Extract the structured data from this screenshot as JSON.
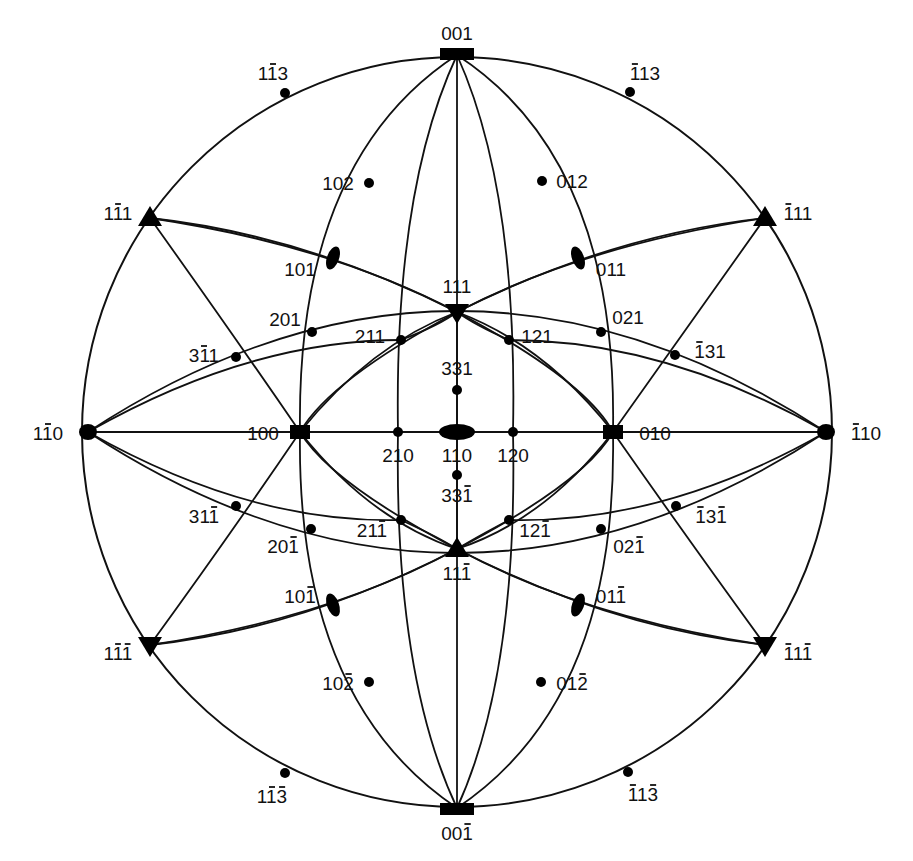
{
  "diagram": {
    "primitive_circle": {
      "cx": 457,
      "cy": 432,
      "r": 375
    },
    "colors": {
      "ink": "#111111",
      "background": "#ffffff"
    },
    "poles": [
      {
        "id": "p001",
        "label": "001",
        "bars": [],
        "x": 457,
        "y": 55,
        "symbol": "square",
        "lx": 457,
        "ly": 40,
        "anchor": "middle"
      },
      {
        "id": "p00m1",
        "label": "001",
        "bars": [
          2
        ],
        "x": 457,
        "y": 808,
        "symbol": "square",
        "lx": 457,
        "ly": 840,
        "anchor": "middle"
      },
      {
        "id": "p1m10",
        "label": "110",
        "bars": [
          1
        ],
        "x": 88,
        "y": 432,
        "symbol": "square-round",
        "lx": 48,
        "ly": 440,
        "anchor": "middle"
      },
      {
        "id": "pm110",
        "label": "110",
        "bars": [
          0
        ],
        "x": 826,
        "y": 432,
        "symbol": "square-round",
        "lx": 866,
        "ly": 440,
        "anchor": "middle"
      },
      {
        "id": "p110",
        "label": "110",
        "bars": [],
        "x": 457,
        "y": 432,
        "symbol": "ellipse-h",
        "lx": 457,
        "ly": 462,
        "anchor": "middle"
      },
      {
        "id": "p100",
        "label": "100",
        "bars": [],
        "x": 300,
        "y": 432,
        "symbol": "square",
        "lx": 263,
        "ly": 440,
        "anchor": "middle"
      },
      {
        "id": "p010",
        "label": "010",
        "bars": [],
        "x": 613,
        "y": 432,
        "symbol": "square",
        "lx": 655,
        "ly": 440,
        "anchor": "middle"
      },
      {
        "id": "p111",
        "label": "111",
        "bars": [],
        "x": 457,
        "y": 312,
        "symbol": "tri-down",
        "lx": 457,
        "ly": 293,
        "anchor": "middle"
      },
      {
        "id": "p11m1",
        "label": "111",
        "bars": [
          2
        ],
        "x": 457,
        "y": 549,
        "symbol": "tri-up",
        "lx": 457,
        "ly": 580,
        "anchor": "middle"
      },
      {
        "id": "p1m11",
        "label": "111",
        "bars": [
          1
        ],
        "x": 150,
        "y": 218,
        "symbol": "tri-up",
        "lx": 118,
        "ly": 220,
        "anchor": "middle"
      },
      {
        "id": "pm111",
        "label": "111",
        "bars": [
          0
        ],
        "x": 765,
        "y": 218,
        "symbol": "tri-up",
        "lx": 798,
        "ly": 220,
        "anchor": "middle"
      },
      {
        "id": "p1m1m1",
        "label": "111",
        "bars": [
          1,
          2
        ],
        "x": 150,
        "y": 645,
        "symbol": "tri-down",
        "lx": 118,
        "ly": 660,
        "anchor": "middle"
      },
      {
        "id": "pm11m1",
        "label": "111",
        "bars": [
          0,
          2
        ],
        "x": 765,
        "y": 645,
        "symbol": "tri-down",
        "lx": 798,
        "ly": 660,
        "anchor": "middle"
      },
      {
        "id": "p101",
        "label": "101",
        "bars": [],
        "x": 333,
        "y": 258,
        "symbol": "ellipse-v",
        "lx": 300,
        "ly": 276,
        "anchor": "middle"
      },
      {
        "id": "p011",
        "label": "011",
        "bars": [],
        "x": 578,
        "y": 258,
        "symbol": "ellipse-v",
        "lx": 611,
        "ly": 276,
        "anchor": "middle"
      },
      {
        "id": "p10m1",
        "label": "101",
        "bars": [
          2
        ],
        "x": 333,
        "y": 605,
        "symbol": "ellipse-v",
        "lx": 300,
        "ly": 603,
        "anchor": "middle"
      },
      {
        "id": "p01m1",
        "label": "011",
        "bars": [
          2
        ],
        "x": 578,
        "y": 605,
        "symbol": "ellipse-v",
        "lx": 611,
        "ly": 603,
        "anchor": "middle"
      },
      {
        "id": "p102",
        "label": "102",
        "bars": [],
        "x": 369,
        "y": 183,
        "symbol": "dot",
        "lx": 338,
        "ly": 190,
        "anchor": "middle"
      },
      {
        "id": "p012",
        "label": "012",
        "bars": [],
        "x": 542,
        "y": 181,
        "symbol": "dot",
        "lx": 572,
        "ly": 188,
        "anchor": "middle"
      },
      {
        "id": "p10m2",
        "label": "102",
        "bars": [
          2
        ],
        "x": 369,
        "y": 682,
        "symbol": "dot",
        "lx": 338,
        "ly": 690,
        "anchor": "middle"
      },
      {
        "id": "p01m2",
        "label": "012",
        "bars": [
          2
        ],
        "x": 541,
        "y": 682,
        "symbol": "dot",
        "lx": 572,
        "ly": 690,
        "anchor": "middle"
      },
      {
        "id": "p1m13",
        "label": "113",
        "bars": [
          1
        ],
        "x": 285,
        "y": 93,
        "symbol": "dot",
        "lx": 273,
        "ly": 80,
        "anchor": "middle"
      },
      {
        "id": "pm113",
        "label": "113",
        "bars": [
          0
        ],
        "x": 630,
        "y": 92,
        "symbol": "dot",
        "lx": 645,
        "ly": 80,
        "anchor": "middle"
      },
      {
        "id": "p1m1m3",
        "label": "113",
        "bars": [
          1,
          2
        ],
        "x": 285,
        "y": 773,
        "symbol": "dot",
        "lx": 272,
        "ly": 803,
        "anchor": "middle"
      },
      {
        "id": "pm11m3",
        "label": "113",
        "bars": [
          0,
          2
        ],
        "x": 628,
        "y": 772,
        "symbol": "dot",
        "lx": 643,
        "ly": 801,
        "anchor": "middle"
      },
      {
        "id": "p201",
        "label": "201",
        "bars": [],
        "x": 312,
        "y": 332,
        "symbol": "dot",
        "lx": 285,
        "ly": 326,
        "anchor": "middle"
      },
      {
        "id": "p021",
        "label": "021",
        "bars": [],
        "x": 601,
        "y": 332,
        "symbol": "dot",
        "lx": 628,
        "ly": 324,
        "anchor": "middle"
      },
      {
        "id": "p20m1",
        "label": "201",
        "bars": [
          2
        ],
        "x": 311,
        "y": 529,
        "symbol": "dot",
        "lx": 283,
        "ly": 553,
        "anchor": "middle"
      },
      {
        "id": "p02m1",
        "label": "021",
        "bars": [
          2
        ],
        "x": 601,
        "y": 529,
        "symbol": "dot",
        "lx": 629,
        "ly": 553,
        "anchor": "middle"
      },
      {
        "id": "p3m11",
        "label": "311",
        "bars": [
          1
        ],
        "x": 236,
        "y": 357,
        "symbol": "dot",
        "lx": 204,
        "ly": 362,
        "anchor": "middle"
      },
      {
        "id": "pm131",
        "label": "131",
        "bars": [
          0
        ],
        "x": 675,
        "y": 355,
        "symbol": "dot",
        "lx": 710,
        "ly": 358,
        "anchor": "middle"
      },
      {
        "id": "p31m1",
        "label": "311",
        "bars": [
          2
        ],
        "x": 236,
        "y": 506,
        "symbol": "dot",
        "lx": 204,
        "ly": 523,
        "anchor": "middle"
      },
      {
        "id": "pm13m1",
        "label": "131",
        "bars": [
          0,
          2
        ],
        "x": 676,
        "y": 506,
        "symbol": "dot",
        "lx": 711,
        "ly": 523,
        "anchor": "middle"
      },
      {
        "id": "p211",
        "label": "211",
        "bars": [],
        "x": 401,
        "y": 340,
        "symbol": "dot",
        "lx": 370,
        "ly": 343,
        "anchor": "middle"
      },
      {
        "id": "p121",
        "label": "121",
        "bars": [],
        "x": 509,
        "y": 340,
        "symbol": "dot",
        "lx": 537,
        "ly": 343,
        "anchor": "middle"
      },
      {
        "id": "p21m1",
        "label": "211",
        "bars": [
          2
        ],
        "x": 401,
        "y": 520,
        "symbol": "dot",
        "lx": 372,
        "ly": 537,
        "anchor": "middle"
      },
      {
        "id": "p12m1",
        "label": "121",
        "bars": [
          2
        ],
        "x": 509,
        "y": 520,
        "symbol": "dot",
        "lx": 535,
        "ly": 537,
        "anchor": "middle"
      },
      {
        "id": "p331",
        "label": "331",
        "bars": [],
        "x": 457,
        "y": 390,
        "symbol": "dot",
        "lx": 457,
        "ly": 375,
        "anchor": "middle"
      },
      {
        "id": "p33m1",
        "label": "331",
        "bars": [
          2
        ],
        "x": 457,
        "y": 475,
        "symbol": "dot",
        "lx": 457,
        "ly": 502,
        "anchor": "middle"
      },
      {
        "id": "p210",
        "label": "210",
        "bars": [],
        "x": 398,
        "y": 432,
        "symbol": "dot",
        "lx": 398,
        "ly": 462,
        "anchor": "middle"
      },
      {
        "id": "p120",
        "label": "120",
        "bars": [],
        "x": 513,
        "y": 432,
        "symbol": "dot",
        "lx": 513,
        "ly": 462,
        "anchor": "middle"
      }
    ]
  }
}
